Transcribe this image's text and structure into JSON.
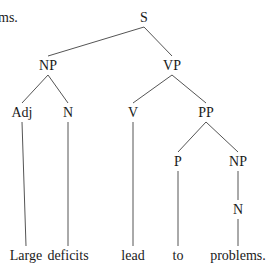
{
  "caption_fragment": "ms.",
  "tree": {
    "nodes": [
      {
        "id": "S",
        "label": "S"
      },
      {
        "id": "NP1",
        "label": "NP"
      },
      {
        "id": "VP",
        "label": "VP"
      },
      {
        "id": "Adj",
        "label": "Adj"
      },
      {
        "id": "N1",
        "label": "N"
      },
      {
        "id": "V",
        "label": "V"
      },
      {
        "id": "PP",
        "label": "PP"
      },
      {
        "id": "P",
        "label": "P"
      },
      {
        "id": "NP2",
        "label": "NP"
      },
      {
        "id": "N2",
        "label": "N"
      },
      {
        "id": "w1",
        "label": "Large"
      },
      {
        "id": "w2",
        "label": "deficits"
      },
      {
        "id": "w3",
        "label": "lead"
      },
      {
        "id": "w4",
        "label": "to"
      },
      {
        "id": "w5",
        "label": "problems."
      }
    ],
    "edges": [
      [
        "S",
        "NP1"
      ],
      [
        "S",
        "VP"
      ],
      [
        "NP1",
        "Adj"
      ],
      [
        "NP1",
        "N1"
      ],
      [
        "VP",
        "V"
      ],
      [
        "VP",
        "PP"
      ],
      [
        "PP",
        "P"
      ],
      [
        "PP",
        "NP2"
      ],
      [
        "NP2",
        "N2"
      ],
      [
        "Adj",
        "w1"
      ],
      [
        "N1",
        "w2"
      ],
      [
        "V",
        "w3"
      ],
      [
        "P",
        "w4"
      ],
      [
        "N2",
        "w5"
      ]
    ]
  }
}
